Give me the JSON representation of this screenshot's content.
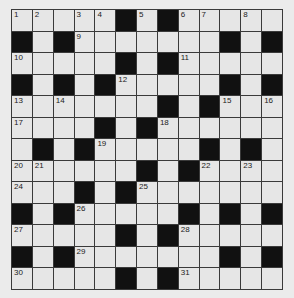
{
  "puzzle": {
    "rows": 13,
    "cols": 13,
    "grid": [
      "....#.#......",
      "#.#......#.#",
      ".....#.#.....",
      "#.#.#....#.#",
      ".......#.#...",
      "....#.#......",
      ".#.#.....#.#.",
      "......#.#....",
      "...#.#.......",
      "#.#....#.#.#",
      ".....#.#.....",
      "#.#......#.#",
      ".....#.#....."
    ],
    "black_cells": [
      [
        0,
        5
      ],
      [
        0,
        7
      ],
      [
        1,
        0
      ],
      [
        1,
        2
      ],
      [
        1,
        10
      ],
      [
        1,
        12
      ],
      [
        2,
        5
      ],
      [
        2,
        7
      ],
      [
        3,
        0
      ],
      [
        3,
        2
      ],
      [
        3,
        4
      ],
      [
        3,
        10
      ],
      [
        3,
        12
      ],
      [
        4,
        7
      ],
      [
        4,
        9
      ],
      [
        5,
        4
      ],
      [
        5,
        6
      ],
      [
        6,
        1
      ],
      [
        6,
        3
      ],
      [
        6,
        9
      ],
      [
        6,
        11
      ],
      [
        7,
        6
      ],
      [
        7,
        8
      ],
      [
        8,
        3
      ],
      [
        8,
        5
      ],
      [
        9,
        0
      ],
      [
        9,
        2
      ],
      [
        9,
        8
      ],
      [
        9,
        10
      ],
      [
        9,
        12
      ],
      [
        10,
        5
      ],
      [
        10,
        7
      ],
      [
        11,
        0
      ],
      [
        11,
        2
      ],
      [
        11,
        10
      ],
      [
        11,
        12
      ],
      [
        12,
        5
      ],
      [
        12,
        7
      ]
    ],
    "numbers": [
      {
        "n": "1",
        "r": 0,
        "c": 0
      },
      {
        "n": "2",
        "r": 0,
        "c": 1
      },
      {
        "n": "3",
        "r": 0,
        "c": 3
      },
      {
        "n": "4",
        "r": 0,
        "c": 4
      },
      {
        "n": "5",
        "r": 0,
        "c": 6
      },
      {
        "n": "6",
        "r": 0,
        "c": 8
      },
      {
        "n": "7",
        "r": 0,
        "c": 9
      },
      {
        "n": "8",
        "r": 0,
        "c": 11
      },
      {
        "n": "9",
        "r": 1,
        "c": 3
      },
      {
        "n": "10",
        "r": 2,
        "c": 0
      },
      {
        "n": "11",
        "r": 2,
        "c": 8
      },
      {
        "n": "12",
        "r": 3,
        "c": 5
      },
      {
        "n": "13",
        "r": 4,
        "c": 0
      },
      {
        "n": "14",
        "r": 4,
        "c": 2
      },
      {
        "n": "15",
        "r": 4,
        "c": 10
      },
      {
        "n": "16",
        "r": 4,
        "c": 12
      },
      {
        "n": "17",
        "r": 5,
        "c": 0
      },
      {
        "n": "18",
        "r": 5,
        "c": 7
      },
      {
        "n": "19",
        "r": 6,
        "c": 4
      },
      {
        "n": "20",
        "r": 7,
        "c": 0
      },
      {
        "n": "21",
        "r": 7,
        "c": 1
      },
      {
        "n": "22",
        "r": 7,
        "c": 9
      },
      {
        "n": "23",
        "r": 7,
        "c": 11
      },
      {
        "n": "24",
        "r": 8,
        "c": 0
      },
      {
        "n": "25",
        "r": 8,
        "c": 6
      },
      {
        "n": "26",
        "r": 9,
        "c": 3
      },
      {
        "n": "27",
        "r": 10,
        "c": 0
      },
      {
        "n": "28",
        "r": 10,
        "c": 8
      },
      {
        "n": "29",
        "r": 11,
        "c": 3
      },
      {
        "n": "30",
        "r": 12,
        "c": 0
      },
      {
        "n": "31",
        "r": 12,
        "c": 8
      }
    ]
  }
}
